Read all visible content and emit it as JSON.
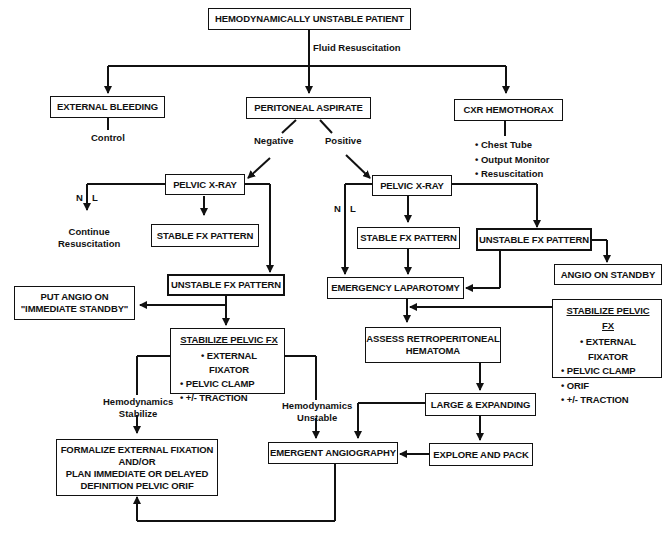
{
  "nodes": {
    "start": "HEMODYNAMICALLY UNSTABLE PATIENT",
    "external_bleeding": "EXTERNAL BLEEDING",
    "peritoneal_aspirate": "PERITONEAL ASPIRATE",
    "cxr_hemothorax": "CXR HEMOTHORAX",
    "pelvic_xray_left": "PELVIC X-RAY",
    "stable_fx_left": "STABLE FX PATTERN",
    "unstable_fx_left": "UNSTABLE FX PATTERN",
    "put_angio": [
      "PUT ANGIO ON",
      "\"IMMEDIATE STANDBY\""
    ],
    "stabilize_left": {
      "title": "STABILIZE PELVIC FX",
      "items": [
        "EXTERNAL FIXATOR",
        "PELVIC CLAMP",
        "+/- TRACTION"
      ]
    },
    "formalize": [
      "FORMALIZE EXTERNAL FIXATION",
      "AND/OR",
      "PLAN IMMEDIATE OR DELAYED",
      "DEFINITION PELVIC ORIF"
    ],
    "pelvic_xray_right": "PELVIC X-RAY",
    "stable_fx_right": "STABLE FX PATTERN",
    "unstable_fx_right": "UNSTABLE FX PATTERN",
    "angio_standby": "ANGIO ON STANDBY",
    "emergency_laparotomy": "EMERGENCY LAPAROTOMY",
    "stabilize_right": {
      "title": "STABILIZE PELVIC FX",
      "items": [
        "EXTERNAL FIXATOR",
        "PELVIC CLAMP",
        "ORIF",
        "+/- TRACTION"
      ]
    },
    "assess_retro": [
      "ASSESS RETROPERITONEAL",
      "HEMATOMA"
    ],
    "large_expanding": "LARGE & EXPANDING",
    "explore_pack": "EXPLORE AND PACK",
    "emergent_angio": "EMERGENT ANGIOGRAPHY"
  },
  "edge_labels": {
    "fluid": "Fluid Resuscitation",
    "control": "Control",
    "negative": "Negative",
    "positive": "Positive",
    "cxr_items": [
      "Chest Tube",
      "Output Monitor",
      "Resuscitation"
    ],
    "nl_left_n": "N",
    "nl_left_l": "L",
    "continue": [
      "Continue",
      "Resuscitation"
    ],
    "nl_right_n": "N",
    "nl_right_l": "L",
    "hemo_stabilize": [
      "Hemodynamics",
      "Stabilize"
    ],
    "hemo_unstable": [
      "Hemodynamics",
      "Unstable"
    ]
  },
  "colors": {
    "line": "#111111",
    "background": "#ffffff"
  }
}
